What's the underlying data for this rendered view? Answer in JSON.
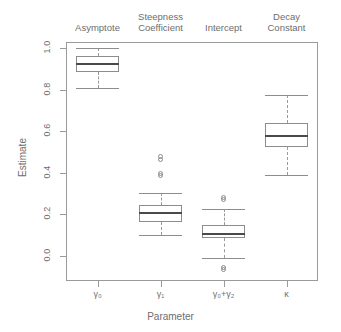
{
  "chart_data": {
    "type": "box",
    "title": "",
    "xlabel": "Parameter",
    "ylabel": "Estimate",
    "ylim": [
      -0.11,
      1.08
    ],
    "yticks": [
      0.0,
      0.2,
      0.4,
      0.6,
      0.8,
      1.0
    ],
    "ytick_labels": [
      "0.0",
      "0.2",
      "0.4",
      "0.6",
      "0.8",
      "1.0"
    ],
    "grid": false,
    "legend": "none",
    "categories": [
      "γ₀",
      "γ₁",
      "γ₀+γ₂",
      "κ"
    ],
    "group_headers": [
      "Asymptote",
      "Steepness\nCoefficient",
      "Intercept",
      "Decay\nConstant"
    ],
    "boxes": [
      {
        "category": "γ₀",
        "header": "Asymptote",
        "whisker_low": 0.81,
        "q1": 0.885,
        "median": 0.925,
        "q3": 0.96,
        "whisker_high": 1.0,
        "outliers": []
      },
      {
        "category": "γ₁",
        "header": "Steepness Coefficient",
        "whisker_low": 0.1,
        "q1": 0.165,
        "median": 0.205,
        "q3": 0.245,
        "whisker_high": 0.305,
        "outliers": [
          0.385,
          0.395,
          0.465,
          0.478
        ]
      },
      {
        "category": "γ₀+γ₂",
        "header": "Intercept",
        "whisker_low": -0.01,
        "q1": 0.085,
        "median": 0.107,
        "q3": 0.148,
        "whisker_high": 0.227,
        "outliers": [
          -0.055,
          -0.063,
          0.272,
          0.283
        ]
      },
      {
        "category": "κ",
        "header": "Decay Constant",
        "whisker_low": 0.39,
        "q1": 0.525,
        "median": 0.578,
        "q3": 0.638,
        "whisker_high": 0.772,
        "outliers": []
      }
    ],
    "colors": {
      "frame": "#9a9a9a",
      "box_border": "#8d8d8d",
      "median": "#4a4a4a",
      "whisker": "#9a9a9a",
      "text": "#6e6e6e",
      "background": "#ffffff"
    }
  },
  "axis": {
    "x_title": "Parameter",
    "y_title": "Estimate"
  }
}
